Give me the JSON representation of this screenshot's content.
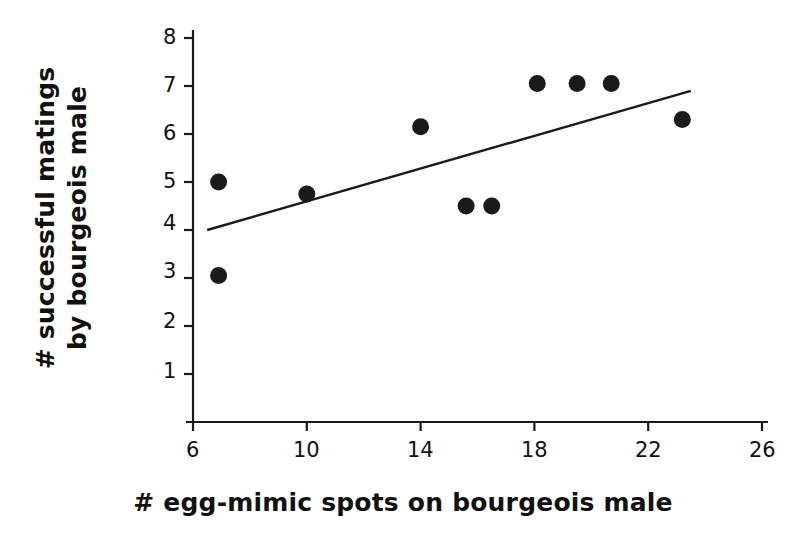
{
  "chart_data": {
    "type": "scatter",
    "title": "",
    "xlabel": "# egg-mimic spots on bourgeois male",
    "ylabel_line1": "# successful matings",
    "ylabel_line2": "by bourgeois male",
    "xlim": [
      6,
      26
    ],
    "ylim": [
      0,
      8
    ],
    "grid": false,
    "legend": "none",
    "xticks": [
      6,
      10,
      14,
      18,
      22,
      26
    ],
    "xtick_labels": [
      "6",
      "10",
      "14",
      "18",
      "22",
      "26"
    ],
    "yticks": [
      1,
      2,
      3,
      4,
      5,
      6,
      7,
      8
    ],
    "ytick_labels": [
      "1",
      "2",
      "3",
      "4",
      "5",
      "6",
      "7",
      "8"
    ],
    "marker": "filled-circle",
    "marker_color": "#1a1a1a",
    "marker_size": 17,
    "line_color": "#1a1a1a",
    "points": [
      {
        "x": 6.9,
        "y": 5.0
      },
      {
        "x": 6.9,
        "y": 3.05
      },
      {
        "x": 10.0,
        "y": 4.75
      },
      {
        "x": 14.0,
        "y": 6.15
      },
      {
        "x": 15.6,
        "y": 4.5
      },
      {
        "x": 16.5,
        "y": 4.5
      },
      {
        "x": 18.1,
        "y": 7.05
      },
      {
        "x": 19.5,
        "y": 7.05
      },
      {
        "x": 20.7,
        "y": 7.05
      },
      {
        "x": 23.2,
        "y": 6.3
      }
    ],
    "trendline": {
      "x_start": 6.5,
      "y_start": 4.0,
      "x_end": 23.5,
      "y_end": 6.9
    }
  },
  "axis": {
    "x_tick_0": "6",
    "x_tick_1": "10",
    "x_tick_2": "14",
    "x_tick_3": "18",
    "x_tick_4": "22",
    "x_tick_5": "26",
    "y_tick_1": "1",
    "y_tick_2": "2",
    "y_tick_3": "3",
    "y_tick_4": "4",
    "y_tick_5": "5",
    "y_tick_6": "6",
    "y_tick_7": "7",
    "y_tick_8": "8"
  },
  "labels": {
    "y_axis_line1": "# successful matings",
    "y_axis_line2": "by bourgeois male",
    "x_axis": "# egg-mimic spots on bourgeois male"
  }
}
